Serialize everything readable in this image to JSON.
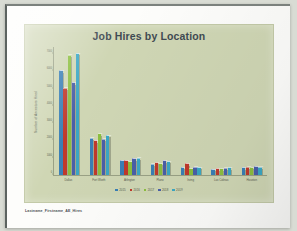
{
  "document": {
    "footer_filename": "Lastname_Firstname_AE_Hires"
  },
  "chart_data": {
    "type": "bar",
    "title": "Job Hires by Location",
    "xlabel": "",
    "ylabel": "Number of Ancestors Hired",
    "categories": [
      "Dallas",
      "Fort Worth",
      "Arlington",
      "Plano",
      "Irving",
      "Las Colinas",
      "Houston"
    ],
    "series": [
      {
        "name": "2015",
        "color": "#3a7fb5",
        "values": [
          6000,
          2100,
          800,
          600,
          400,
          300,
          380
        ]
      },
      {
        "name": "2016",
        "color": "#c0392b",
        "values": [
          5000,
          1950,
          820,
          700,
          620,
          340,
          420
        ]
      },
      {
        "name": "2017",
        "color": "#8cbf3f",
        "values": [
          6900,
          2350,
          760,
          640,
          350,
          330,
          400
        ]
      },
      {
        "name": "2018",
        "color": "#4a5fa8",
        "values": [
          5300,
          2050,
          900,
          800,
          420,
          360,
          460
        ]
      },
      {
        "name": "2019",
        "color": "#3ba7c4",
        "values": [
          7000,
          2250,
          950,
          760,
          400,
          380,
          430
        ]
      }
    ],
    "yticks": [
      0,
      1000,
      2000,
      3000,
      4000,
      5000,
      6000,
      7000
    ],
    "ylim": [
      0,
      7400
    ],
    "grid": false,
    "legend_position": "bottom",
    "background_color": "#cfd6b4",
    "title_color": "#3f4a52"
  }
}
